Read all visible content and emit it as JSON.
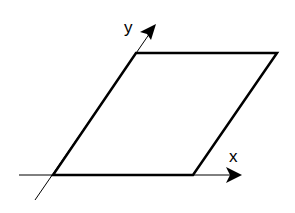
{
  "diagram": {
    "type": "parallelogram-on-oblique-axes",
    "axes": {
      "x_label": "x",
      "y_label": "y"
    },
    "shape": {
      "name": "parallelogram",
      "vertices_px": [
        [
          53,
          175
        ],
        [
          193,
          175
        ],
        [
          277,
          53
        ],
        [
          136,
          53
        ]
      ]
    },
    "colors": {
      "stroke": "#000000",
      "background": "#ffffff"
    }
  }
}
